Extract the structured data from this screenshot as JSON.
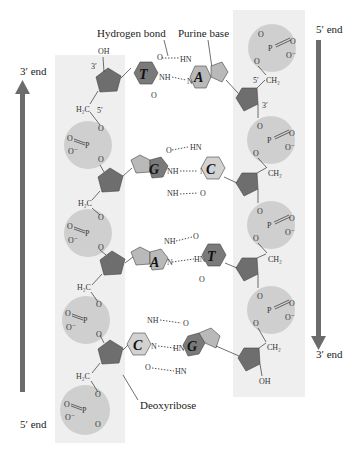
{
  "figure": {
    "labels": {
      "hydrogen_bond": "Hydrogen bond",
      "purine_base": "Purine base",
      "deoxyribose": "Deoxyribose"
    },
    "left_strand": {
      "top_label": "3′ end",
      "bottom_label": "5′ end",
      "direction": "up"
    },
    "right_strand": {
      "top_label": "5′ end",
      "bottom_label": "3′ end",
      "direction": "down"
    },
    "base_pairs": [
      {
        "left": "T",
        "right": "A"
      },
      {
        "left": "G",
        "right": "C"
      },
      {
        "left": "A",
        "right": "T"
      },
      {
        "left": "C",
        "right": "G"
      }
    ],
    "atoms": {
      "oh": "OH",
      "h2c": "H₂C",
      "ch2": "CH₂",
      "p": "P",
      "o": "O",
      "o_minus": "O⁻",
      "nh": "NH",
      "hn": "HN",
      "n": "N",
      "three_prime": "3′",
      "five_prime": "5′"
    },
    "colors": {
      "strand_band": "#eeeeee",
      "phosphate": "#cfcfcf",
      "sugar": "#6e6e6e",
      "purine_ring": "#b9b9b9",
      "pyrimidine_dark": "#7a7a7a",
      "pyrimidine_light": "#d2d2d2",
      "arrow": "#6b6b6b"
    }
  }
}
